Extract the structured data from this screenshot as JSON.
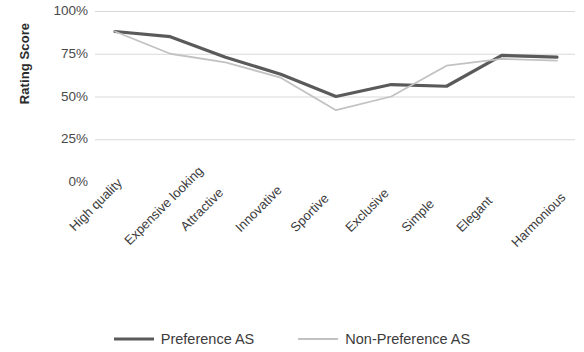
{
  "chart_data": {
    "type": "line",
    "title": "",
    "xlabel": "",
    "ylabel": "Rating Score",
    "ylim": [
      0,
      100
    ],
    "yticks": [
      0,
      25,
      50,
      75,
      100
    ],
    "ytick_labels": [
      "0%",
      "25%",
      "50%",
      "75%",
      "100%"
    ],
    "grid": true,
    "legend_position": "bottom",
    "categories": [
      "High quality",
      "Expensive looking",
      "Attractive",
      "Innovative",
      "Sportive",
      "Exclusive",
      "Simple",
      "Elegant",
      "Harmonious"
    ],
    "series": [
      {
        "name": "Preference AS",
        "color": "#5a5a5a",
        "width": 3.2,
        "values": [
          88,
          85,
          73,
          63,
          50,
          57,
          56,
          74,
          73
        ]
      },
      {
        "name": "Non-Preference AS",
        "color": "#c2c2c2",
        "width": 1.8,
        "values": [
          88,
          75,
          70,
          61,
          42,
          50,
          68,
          72,
          71
        ]
      }
    ]
  },
  "axis": {
    "y_title": "Rating Score",
    "y_ticks": [
      "100%",
      "75%",
      "50%",
      "25%",
      "0%"
    ]
  },
  "legend": {
    "items": [
      {
        "label": "Preference AS",
        "color": "#5a5a5a"
      },
      {
        "label": "Non-Preference AS",
        "color": "#c2c2c2"
      }
    ]
  },
  "colors": {
    "preference": "#5a5a5a",
    "non_preference": "#c2c2c2",
    "grid": "#d9d9d9",
    "axis": "#d0d0d0",
    "text": "#3c3c3c"
  }
}
